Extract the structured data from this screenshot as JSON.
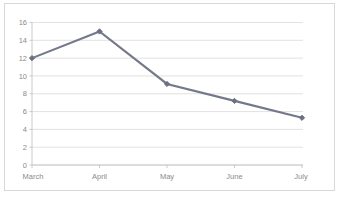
{
  "chart_data": {
    "type": "line",
    "title": "",
    "subtitle": "",
    "xlabel": "",
    "ylabel": "",
    "categories": [
      "March",
      "April",
      "May",
      "June",
      "July"
    ],
    "series": [
      {
        "name": "",
        "values": [
          12,
          15,
          9.1,
          7.2,
          5.3
        ]
      }
    ],
    "ylim": [
      0,
      16
    ],
    "ytick_labels": [
      "0",
      "2",
      "4",
      "6",
      "8",
      "10",
      "12",
      "14",
      "16"
    ],
    "ytick_values": [
      0,
      2,
      4,
      6,
      8,
      10,
      12,
      14,
      16
    ],
    "grid": true,
    "grid_axis": "y",
    "legend": false,
    "legend_position": "none",
    "markers": true,
    "marker_shape": "diamond",
    "colors": {
      "line": "#74798a",
      "marker": "#6b7082",
      "gridline": "#d6d6d6",
      "axis": "#c4c4c4",
      "tick_text": "#8a8a8a",
      "frame_border": "#d8d8d8",
      "background": "#ffffff"
    }
  }
}
